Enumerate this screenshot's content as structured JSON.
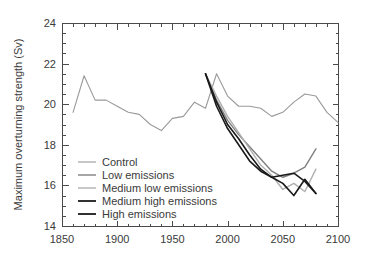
{
  "chart_data": {
    "type": "line",
    "title": "",
    "xlabel": "",
    "ylabel": "Maximum overturning strength (Sv)",
    "xlim": [
      1850,
      2100
    ],
    "ylim": [
      14,
      24
    ],
    "xticks": [
      1850,
      1900,
      1950,
      2000,
      2050,
      2100
    ],
    "yticks": [
      14,
      16,
      18,
      20,
      22,
      24
    ],
    "xtick_labels": [
      "1850",
      "1900",
      "1950",
      "2000",
      "2050",
      "2100"
    ],
    "ytick_labels": [
      "14",
      "16",
      "18",
      "20",
      "22",
      "24"
    ],
    "x_minor_interval": 10,
    "y_minor_interval": 0.5,
    "grid": false,
    "legend_position": "lower-left-inside",
    "series": [
      {
        "name": "Control",
        "color": "#9a9a9a",
        "width": 1.1,
        "x": [
          1860,
          1870,
          1880,
          1890,
          1900,
          1910,
          1920,
          1930,
          1940,
          1950,
          1960,
          1970,
          1980,
          1990,
          2000,
          2010,
          2020,
          2030,
          2040,
          2050,
          2060,
          2070,
          2080,
          2090,
          2100
        ],
        "y": [
          19.6,
          21.4,
          20.2,
          20.2,
          19.9,
          19.6,
          19.5,
          19.0,
          18.7,
          19.3,
          19.4,
          20.1,
          19.8,
          21.5,
          20.4,
          19.9,
          19.9,
          19.8,
          19.4,
          19.6,
          20.1,
          20.5,
          20.4,
          19.6,
          19.1
        ]
      },
      {
        "name": "Low emissions",
        "color": "#808080",
        "width": 1.4,
        "x": [
          1980,
          1990,
          2000,
          2010,
          2020,
          2030,
          2040,
          2050,
          2060,
          2070,
          2080
        ],
        "y": [
          21.5,
          20.2,
          19.2,
          18.5,
          17.9,
          17.3,
          16.7,
          16.4,
          16.6,
          16.9,
          17.8
        ]
      },
      {
        "name": "Medium low emissions",
        "color": "#b0b0b0",
        "width": 1.4,
        "x": [
          1980,
          1990,
          2000,
          2010,
          2020,
          2030,
          2040,
          2050,
          2060,
          2070,
          2080
        ],
        "y": [
          21.5,
          20.4,
          19.4,
          18.6,
          17.8,
          17.0,
          16.5,
          15.8,
          16.1,
          15.7,
          16.8
        ]
      },
      {
        "name": "Medium high emissions",
        "color": "#1a1a1a",
        "width": 1.6,
        "x": [
          1980,
          1990,
          2000,
          2010,
          2020,
          2030,
          2040,
          2050,
          2060,
          2070,
          2080
        ],
        "y": [
          21.5,
          20.1,
          19.0,
          18.3,
          17.5,
          16.8,
          16.4,
          16.5,
          16.6,
          16.2,
          15.6
        ]
      },
      {
        "name": "High emissions",
        "color": "#1a1a1a",
        "width": 1.6,
        "x": [
          1980,
          1990,
          2000,
          2010,
          2020,
          2030,
          2040,
          2050,
          2060,
          2070,
          2080
        ],
        "y": [
          21.5,
          19.9,
          18.8,
          18.0,
          17.2,
          16.7,
          16.4,
          16.1,
          15.5,
          16.3,
          15.6
        ]
      }
    ]
  },
  "legend": {
    "items": [
      {
        "label": "Control",
        "color": "#9a9a9a",
        "width": 1.1
      },
      {
        "label": "Low emissions",
        "color": "#808080",
        "width": 1.4
      },
      {
        "label": "Medium low emissions",
        "color": "#b0b0b0",
        "width": 1.4
      },
      {
        "label": "Medium high emissions",
        "color": "#1a1a1a",
        "width": 1.8
      },
      {
        "label": "High emissions",
        "color": "#1a1a1a",
        "width": 1.8
      }
    ]
  },
  "axes": {
    "y_title": "Maximum overturning strength (Sv)"
  }
}
